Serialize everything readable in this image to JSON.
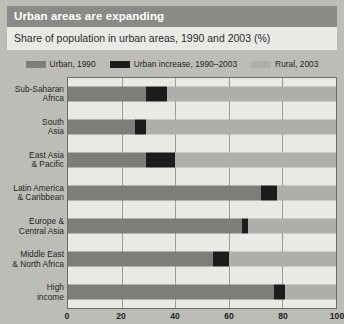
{
  "header": {
    "title": "Urban areas are expanding",
    "subtitle": "Share of population in urban areas, 1990 and 2003 (%)"
  },
  "colors": {
    "urban_1990": "#7d7d79",
    "urban_increase": "#1c1c1c",
    "rural_2003": "#aeaeaa",
    "panel_background": "#e9e9e6",
    "figure_background": "#bdbdb8",
    "title_band": "#8a8a86",
    "gridline": "#9a9a96",
    "axis": "#6d6d69",
    "text": "#1f1f1f"
  },
  "chart_data": {
    "type": "bar",
    "orientation": "horizontal",
    "stacked": true,
    "title": "Urban areas are expanding",
    "subtitle": "Share of population in urban areas, 1990 and 2003 (%)",
    "xlabel": "",
    "ylabel": "",
    "xlim": [
      0,
      100
    ],
    "xticks": [
      0,
      20,
      40,
      60,
      80,
      100
    ],
    "xticklabels": [
      "0",
      "20",
      "40",
      "60",
      "80",
      "100"
    ],
    "grid": true,
    "grid_axis": "x",
    "legend_position": "top-center",
    "categories": [
      "Sub-Saharan\nAfrica",
      "South\nAsia",
      "East Asia\n& Pacific",
      "Latin America\n& Caribbean",
      "Europe &\nCentral Asia",
      "Middle East\n& North Africa",
      "High\nincome"
    ],
    "series": [
      {
        "name": "Urban, 1990",
        "color": "#7d7d79",
        "values": [
          29,
          25,
          29,
          72,
          65,
          54,
          77
        ]
      },
      {
        "name": "Urban increase, 1990–2003",
        "color": "#1c1c1c",
        "values": [
          8,
          4,
          11,
          6,
          2,
          6,
          4
        ]
      },
      {
        "name": "Rural, 2003",
        "color": "#aeaeaa",
        "values": [
          63,
          71,
          60,
          22,
          33,
          40,
          19
        ]
      }
    ]
  }
}
